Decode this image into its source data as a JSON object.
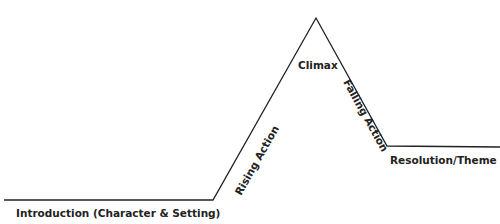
{
  "diagram": {
    "type": "plot-structure",
    "line_color": "#222222",
    "text_color": "#222222",
    "background": "#ffffff",
    "points": {
      "start": [
        4,
        200
      ],
      "rise_start": [
        213,
        200
      ],
      "peak": [
        316,
        18
      ],
      "fall_end": [
        387,
        146
      ],
      "end": [
        500,
        147
      ]
    },
    "labels": {
      "introduction": "Introduction (Character & Setting)",
      "rising_action": "Rising Action",
      "climax": "Climax",
      "falling_action": "Falling Action",
      "resolution": "Resolution/Theme"
    }
  }
}
